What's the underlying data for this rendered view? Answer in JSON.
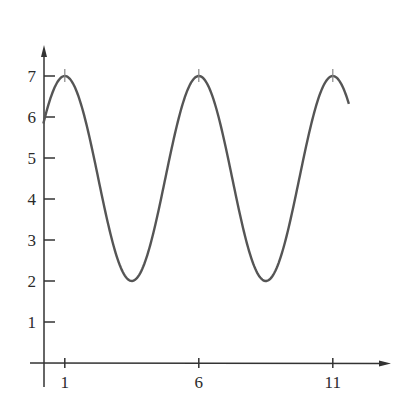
{
  "chart_data": {
    "type": "line",
    "title": "",
    "xlabel": "",
    "ylabel": "",
    "function": "y = 4.5 + 2.5*cos(2*pi*(x-1)/5)",
    "x_ticks": [
      1,
      6,
      11
    ],
    "y_ticks": [
      1,
      2,
      3,
      4,
      5,
      6,
      7
    ],
    "xlim": [
      -0.2,
      13
    ],
    "ylim": [
      0,
      8
    ],
    "grid": false,
    "legend": null,
    "series": [
      {
        "name": "curve",
        "x": [
          0.2,
          1,
          2,
          3.5,
          5,
          6,
          7,
          8.5,
          10,
          11,
          11.6
        ],
        "y": [
          5.4,
          7,
          5.3,
          2,
          5.3,
          7,
          5.3,
          2,
          5.3,
          7,
          6.3
        ]
      }
    ],
    "annotations": [
      "small vertical marks at maxima x=1, 6, 11"
    ],
    "colors": {
      "curve": "#555555",
      "axes": "#333333"
    }
  },
  "labels": {
    "x": [
      "1",
      "6",
      "11"
    ],
    "y": [
      "1",
      "2",
      "3",
      "4",
      "5",
      "6",
      "7"
    ]
  }
}
